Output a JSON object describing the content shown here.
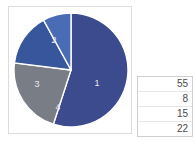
{
  "chart_data": {
    "type": "pie",
    "title": "",
    "categories": [
      "1",
      "2",
      "3",
      "4"
    ],
    "values": [
      55,
      22,
      15,
      8
    ],
    "labels": [
      "1",
      "2",
      "3",
      "4"
    ],
    "colors": [
      "#3c4a8e",
      "#787d86",
      "#38569b",
      "#4a6cb5"
    ],
    "legend": "none",
    "start_angle_deg": 0,
    "direction": "clockwise",
    "label_color": "#e9eaee",
    "border_color": "#dcdcdc"
  },
  "chart_panel": {
    "name": "pie-chart",
    "slices": [
      {
        "label": "1",
        "value": 55,
        "color": "#3c4a8e",
        "label_x": 84,
        "label_y": 75
      },
      {
        "label": "2",
        "value": 22,
        "color": "#787d86",
        "label_x": 41,
        "label_y": 32
      },
      {
        "label": "3",
        "value": 15,
        "color": "#38569b",
        "label_x": 24,
        "label_y": 76
      },
      {
        "label": "4",
        "value": 8,
        "color": "#4a6cb5",
        "label_x": 45,
        "label_y": 99
      }
    ]
  },
  "table_panel": {
    "name": "data-table",
    "columns": [
      "",
      "value"
    ],
    "rows": [
      {
        "value": "55"
      },
      {
        "value": "8"
      },
      {
        "value": "15"
      },
      {
        "value": "22"
      }
    ]
  }
}
